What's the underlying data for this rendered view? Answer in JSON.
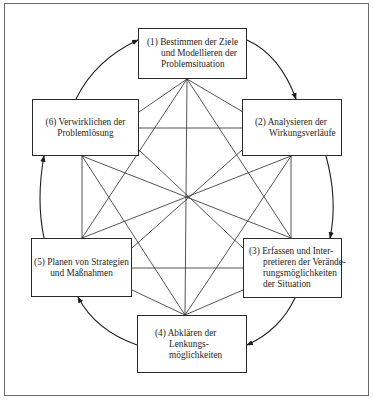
{
  "diagram": {
    "type": "cyclic process with full interconnection",
    "steps": [
      {
        "id": 1,
        "number": "(1)",
        "lines": [
          "(1) Bestimmen der Ziele",
          "und Modellieren der",
          "Problemsituation"
        ]
      },
      {
        "id": 2,
        "number": "(2)",
        "lines": [
          "(2) Analysieren der",
          "Wirkungsverläufe"
        ]
      },
      {
        "id": 3,
        "number": "(3)",
        "lines": [
          "(3) Erfassen und Inter-",
          "pretieren der Verände-",
          "rungsmöglichkeiten",
          "der Situation"
        ]
      },
      {
        "id": 4,
        "number": "(4)",
        "lines": [
          "(4) Abklären der",
          "Lenkungs-",
          "möglichkeiten"
        ]
      },
      {
        "id": 5,
        "number": "(5)",
        "lines": [
          "(5) Planen von Strategien",
          "und Maßnahmen"
        ]
      },
      {
        "id": 6,
        "number": "(6)",
        "lines": [
          "(6) Verwirklichen der",
          "Problemlösung"
        ]
      }
    ],
    "cycle_order": [
      1,
      2,
      3,
      4,
      5,
      6,
      1
    ],
    "cycle_direction": "clockwise",
    "connections": "every step linked to every other step by straight lines",
    "colors": {
      "line": "#2a2a2a",
      "frame": "#6a6a6a",
      "background": "#ffffff",
      "text": "#1e1e1e"
    }
  }
}
